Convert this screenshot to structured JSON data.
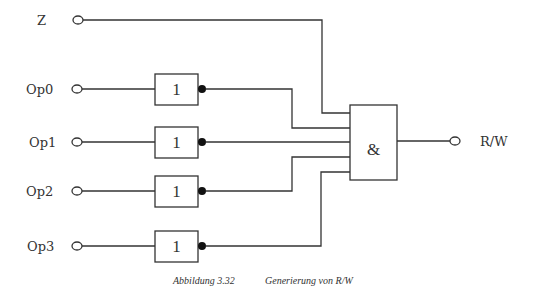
{
  "diagram": {
    "inputs": [
      {
        "label": "Z",
        "y": 20
      },
      {
        "label": "Op0",
        "y": 89
      },
      {
        "label": "Op1",
        "y": 142
      },
      {
        "label": "Op2",
        "y": 191
      },
      {
        "label": "Op3",
        "y": 246
      }
    ],
    "inverters": [
      {
        "label": "1",
        "input": "Op0"
      },
      {
        "label": "1",
        "input": "Op1"
      },
      {
        "label": "1",
        "input": "Op2"
      },
      {
        "label": "1",
        "input": "Op3"
      }
    ],
    "and_gate": {
      "label": "&"
    },
    "output": {
      "label": "R/W"
    },
    "caption": {
      "figure": "Abbildung 3.32",
      "title": "Generierung von R/W"
    }
  }
}
